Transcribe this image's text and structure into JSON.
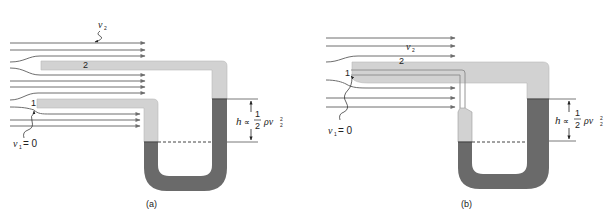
{
  "figure": {
    "colors": {
      "background": "#ffffff",
      "streamline": "#6e6e6e",
      "tube_light": "#d2d2d2",
      "tube_outline": "#b9b9b9",
      "fluid_dark": "#6a6a6a",
      "dashed_level": "#444444",
      "marker_line": "#555555"
    },
    "panels": [
      {
        "id": "a",
        "caption": "(a)",
        "label_point_2": "2",
        "label_point_1": "1",
        "label_v2": "v",
        "label_v2_sub": "2",
        "label_v1": "v",
        "label_v1_sub": "1",
        "label_v1_eq": "= 0",
        "formula": {
          "h": "h",
          "prop": "∝",
          "num": "1",
          "den": "2",
          "rho": "ρv",
          "sub": "2",
          "sup": "2"
        }
      },
      {
        "id": "b",
        "caption": "(b)",
        "label_point_2": "2",
        "label_point_1": "1",
        "label_v2": "v",
        "label_v2_sub": "2",
        "label_v1": "v",
        "label_v1_sub": "1",
        "label_v1_eq": "= 0",
        "formula": {
          "h": "h",
          "prop": "∝",
          "num": "1",
          "den": "2",
          "rho": "ρv",
          "sub": "2",
          "sup": "2"
        }
      }
    ]
  }
}
